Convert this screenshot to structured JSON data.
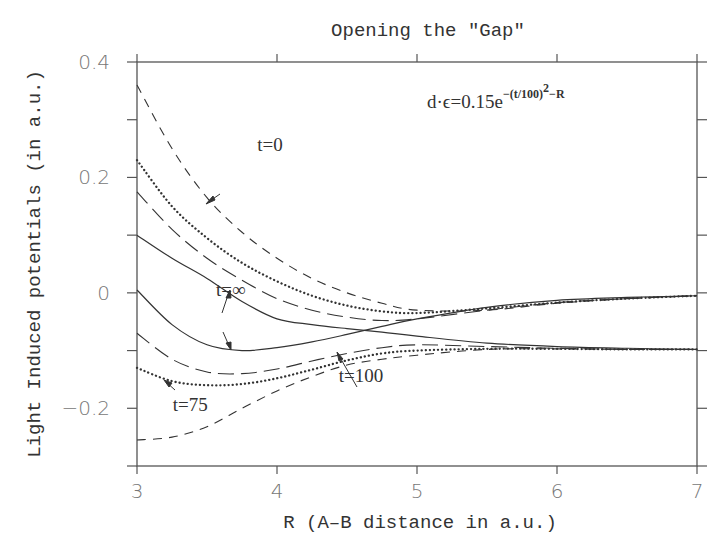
{
  "chart_data": {
    "type": "line",
    "title": "Opening the \"Gap\"",
    "xlabel": "R (A–B distance in a.u.)",
    "ylabel": "Light Induced potentials (in a.u.)",
    "xlim": [
      3,
      7
    ],
    "ylim": [
      -0.3,
      0.4
    ],
    "x_ticks": [
      "3",
      "4",
      "5",
      "6",
      "7"
    ],
    "y_ticks": [
      "0.4",
      "0.2",
      "0",
      "−0.2"
    ],
    "grid": false,
    "annotation_formula": {
      "base": "d·ϵ=0.15e",
      "exponent": "−(t/100)",
      "exponent_power": "2",
      "exponent_tail": "−R"
    },
    "series": [
      {
        "name": "t=0 upper",
        "style": "short-dash",
        "x": [
          3,
          3.25,
          3.5,
          3.75,
          4,
          4.25,
          4.5,
          4.75,
          5,
          5.5,
          6,
          6.5,
          7
        ],
        "values": [
          0.36,
          0.25,
          0.165,
          0.105,
          0.06,
          0.025,
          0.0,
          -0.018,
          -0.03,
          -0.03,
          -0.018,
          -0.01,
          -0.005
        ]
      },
      {
        "name": "t=0 lower",
        "style": "short-dash",
        "x": [
          3,
          3.25,
          3.5,
          3.75,
          4,
          4.25,
          4.5,
          4.75,
          5,
          5.5,
          6,
          6.5,
          7
        ],
        "values": [
          -0.255,
          -0.25,
          -0.232,
          -0.2,
          -0.17,
          -0.145,
          -0.125,
          -0.115,
          -0.108,
          -0.098,
          -0.097,
          -0.098,
          -0.098
        ]
      },
      {
        "name": "t=75 upper",
        "style": "dotted",
        "x": [
          3,
          3.25,
          3.5,
          3.75,
          4,
          4.25,
          4.5,
          4.75,
          5,
          5.5,
          6,
          6.5,
          7
        ],
        "values": [
          0.23,
          0.15,
          0.095,
          0.052,
          0.02,
          -0.005,
          -0.022,
          -0.032,
          -0.035,
          -0.027,
          -0.017,
          -0.01,
          -0.005
        ]
      },
      {
        "name": "t=75 lower",
        "style": "dotted",
        "x": [
          3,
          3.25,
          3.5,
          3.75,
          4,
          4.25,
          4.5,
          4.75,
          5,
          5.5,
          6,
          6.5,
          7
        ],
        "values": [
          -0.13,
          -0.153,
          -0.16,
          -0.158,
          -0.148,
          -0.133,
          -0.117,
          -0.105,
          -0.1,
          -0.097,
          -0.097,
          -0.098,
          -0.098
        ]
      },
      {
        "name": "t=100 upper",
        "style": "long-dash",
        "x": [
          3,
          3.25,
          3.5,
          3.75,
          4,
          4.25,
          4.5,
          4.75,
          5,
          5.5,
          6,
          6.5,
          7
        ],
        "values": [
          0.175,
          0.11,
          0.06,
          0.022,
          -0.01,
          -0.03,
          -0.042,
          -0.048,
          -0.045,
          -0.03,
          -0.017,
          -0.01,
          -0.005
        ]
      },
      {
        "name": "t=100 lower",
        "style": "long-dash",
        "x": [
          3,
          3.25,
          3.5,
          3.75,
          4,
          4.25,
          4.5,
          4.75,
          5,
          5.5,
          6,
          6.5,
          7
        ],
        "values": [
          -0.07,
          -0.115,
          -0.137,
          -0.14,
          -0.132,
          -0.118,
          -0.105,
          -0.095,
          -0.09,
          -0.093,
          -0.096,
          -0.098,
          -0.098
        ]
      },
      {
        "name": "t=∞ upper",
        "style": "solid",
        "x": [
          3,
          3.25,
          3.5,
          3.75,
          4,
          4.25,
          4.5,
          4.75,
          5,
          5.5,
          6,
          6.5,
          7
        ],
        "values": [
          0.1,
          0.06,
          0.025,
          -0.015,
          -0.045,
          -0.055,
          -0.062,
          -0.068,
          -0.075,
          -0.087,
          -0.093,
          -0.096,
          -0.098
        ]
      },
      {
        "name": "t=∞ lower",
        "style": "solid",
        "x": [
          3,
          3.25,
          3.5,
          3.75,
          4,
          4.25,
          4.5,
          4.75,
          5,
          5.5,
          6,
          6.5,
          7
        ],
        "values": [
          0.005,
          -0.055,
          -0.09,
          -0.1,
          -0.095,
          -0.085,
          -0.072,
          -0.058,
          -0.045,
          -0.025,
          -0.013,
          -0.008,
          -0.005
        ]
      }
    ],
    "labels": [
      {
        "text": "t=0",
        "x": 3.95,
        "y": 0.245
      },
      {
        "text": "t=∞",
        "x": 3.67,
        "y": -0.005
      },
      {
        "text": "t=75",
        "x": 3.38,
        "y": -0.205
      },
      {
        "text": "t=100",
        "x": 4.6,
        "y": -0.155
      }
    ]
  }
}
